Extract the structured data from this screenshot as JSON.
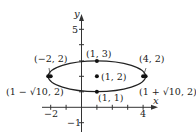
{
  "diagram": {
    "type": "ellipse-graph",
    "axes": {
      "x_label": "x",
      "y_label": "y",
      "x_ticks_labeled": [
        "−2",
        "4"
      ],
      "y_ticks_labeled": [
        "5",
        "−1"
      ],
      "x_range": [
        -3,
        5
      ],
      "y_range": [
        -2,
        6
      ]
    },
    "ellipse": {
      "center": [
        1,
        2
      ],
      "semi_major": 3.1623,
      "semi_minor": 1
    },
    "points": [
      {
        "label": "(1, 3)",
        "x": 1,
        "y": 3
      },
      {
        "label": "(1, 2)",
        "x": 1,
        "y": 2
      },
      {
        "label": "(1, 1)",
        "x": 1,
        "y": 1
      },
      {
        "label": "(−2, 2)",
        "x": -2,
        "y": 2
      },
      {
        "label": "(4, 2)",
        "x": 4,
        "y": 2
      },
      {
        "label": "(1 − √10, 2)",
        "x": -2.1623,
        "y": 2
      },
      {
        "label": "(1 + √10, 2)",
        "x": 4.1623,
        "y": 2
      }
    ]
  }
}
